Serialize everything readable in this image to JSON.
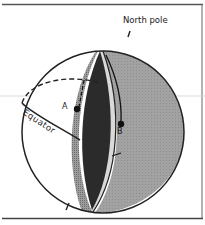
{
  "figure": {
    "labels": {
      "north_pole": "North pole",
      "equator": "Equator",
      "point_a": "A",
      "point_b": "B"
    },
    "colors": {
      "frame": "#444444",
      "outline": "#222222",
      "inner_wedge_dark": "#2b2b2b",
      "wedge_hatch": "#8a8a8a",
      "wedge_edge_light": "#d6d6d6",
      "right_hemisphere": "#9a9a9a",
      "background": "#ffffff"
    },
    "elements": [
      "sphere-outline",
      "equator-front",
      "equator-back-dashed",
      "cut-wedge-dark-interior",
      "shaded-right-hemisphere",
      "north-pole-tick",
      "south-pole-tick",
      "point-a-marker",
      "point-b-marker",
      "horizontal-reference-line"
    ]
  }
}
